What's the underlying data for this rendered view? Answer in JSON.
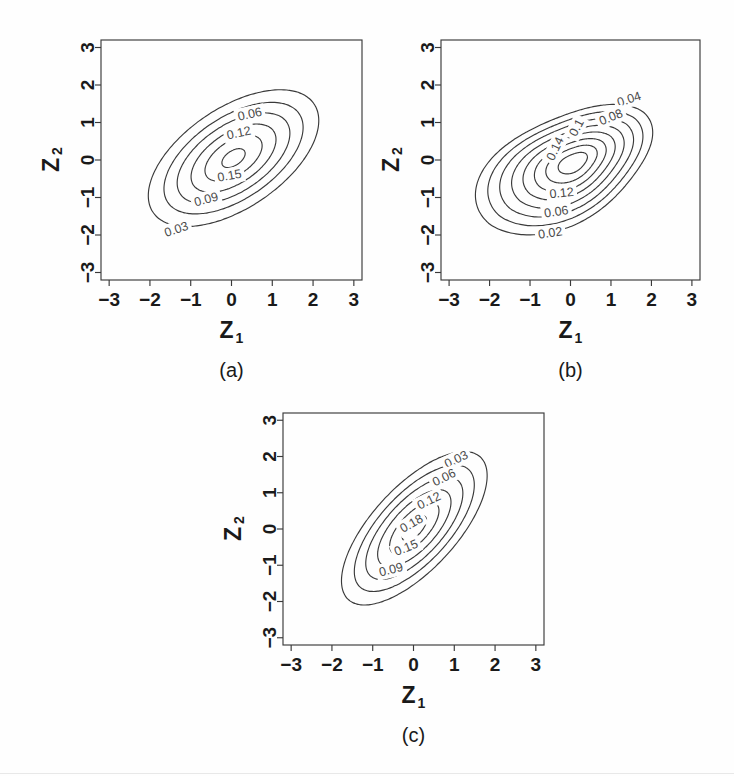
{
  "figure": {
    "kind": "contour-plot-figure",
    "background": "#fefefe",
    "stroke_color": "#3a3a3a",
    "text_color": "#1a1a1a",
    "panel_count": 3
  },
  "chart_data": [
    {
      "type": "line",
      "panel_id": "a",
      "panel_label": "(a)",
      "subtype": "contour",
      "title": "",
      "xlabel": "Z1",
      "ylabel": "Z2",
      "xlabel_display": "Z",
      "xlabel_sub": "1",
      "ylabel_display": "Z",
      "ylabel_sub": "2",
      "xlim": [
        -3.2,
        3.2
      ],
      "ylim": [
        -3.2,
        3.2
      ],
      "xticks": [
        -3,
        -2,
        -1,
        0,
        1,
        2,
        3
      ],
      "xticklabels": [
        "-3",
        "-2",
        "-1",
        "0",
        "1",
        "2",
        "3"
      ],
      "yticks": [
        -3,
        -2,
        -1,
        0,
        1,
        2,
        3
      ],
      "yticklabels": [
        "-3",
        "-2",
        "-1",
        "0",
        "1",
        "2",
        "3"
      ],
      "grid": false,
      "legend": false,
      "center": [
        0.05,
        0.05
      ],
      "orientation_deg": 38,
      "levels": [
        0.03,
        0.06,
        0.09,
        0.12,
        0.15,
        0.18
      ],
      "contour_labels": [
        "0.03",
        "0.06",
        "0.09",
        "0.12",
        "0.15"
      ],
      "contours": [
        {
          "level": 0.03,
          "label": "0.03",
          "rx": 2.45,
          "ry": 1.3,
          "label_xy": [
            -1.35,
            -1.85
          ],
          "label_rot": -18
        },
        {
          "level": 0.06,
          "label": "",
          "rx": 2.0,
          "ry": 1.06
        },
        {
          "level": 0.09,
          "label": "0.09",
          "rx": 1.62,
          "ry": 0.86,
          "label_xy": [
            -0.62,
            -1.05
          ],
          "label_rot": -15
        },
        {
          "level": 0.12,
          "label": "0.06",
          "rx": 1.22,
          "ry": 0.65,
          "label_xy": [
            0.45,
            1.22
          ],
          "label_rot": -12
        },
        {
          "level": 0.15,
          "label": "0.12",
          "rx": 0.82,
          "ry": 0.44,
          "label_xy": [
            0.18,
            0.72
          ],
          "label_rot": -12
        },
        {
          "level": 0.18,
          "label": "0.15",
          "rx": 0.33,
          "ry": 0.19,
          "label_xy": [
            -0.05,
            -0.42
          ],
          "label_rot": -10
        }
      ]
    },
    {
      "type": "line",
      "panel_id": "b",
      "panel_label": "(b)",
      "subtype": "contour",
      "title": "",
      "xlabel": "Z1",
      "ylabel": "Z2",
      "xlabel_display": "Z",
      "xlabel_sub": "1",
      "ylabel_display": "Z",
      "ylabel_sub": "2",
      "xlim": [
        -3.2,
        3.2
      ],
      "ylim": [
        -3.2,
        3.2
      ],
      "xticks": [
        -3,
        -2,
        -1,
        0,
        1,
        2,
        3
      ],
      "xticklabels": [
        "-3",
        "-2",
        "-1",
        "0",
        "1",
        "2",
        "3"
      ],
      "yticks": [
        -3,
        -2,
        -1,
        0,
        1,
        2,
        3
      ],
      "yticklabels": [
        "-3",
        "-2",
        "-1",
        "0",
        "1",
        "2",
        "3"
      ],
      "grid": false,
      "legend": false,
      "center": [
        0.1,
        -0.05
      ],
      "shape": "teardrop-skewed-upper-right",
      "levels": [
        0.02,
        0.04,
        0.06,
        0.08,
        0.1,
        0.12,
        0.14,
        0.16
      ],
      "contour_labels": [
        "0.02",
        "0.04",
        "0.06",
        "0.08",
        "0.1",
        "0.12",
        "0.14"
      ],
      "contours": [
        {
          "level": 0.02,
          "label": "0.02",
          "scale": 1.0,
          "label_xy": [
            -0.5,
            -1.95
          ],
          "label_rot": -8
        },
        {
          "level": 0.04,
          "label": "0.04",
          "scale": 0.875,
          "label_xy": [
            1.45,
            1.62
          ],
          "label_rot": -18
        },
        {
          "level": 0.06,
          "label": "0.06",
          "scale": 0.755,
          "label_xy": [
            -0.35,
            -1.38
          ],
          "label_rot": -8
        },
        {
          "level": 0.08,
          "label": "0.08",
          "scale": 0.635,
          "label_xy": [
            1.0,
            1.14
          ],
          "label_rot": -22
        },
        {
          "level": 0.1,
          "label": "0.1",
          "scale": 0.52,
          "label_xy": [
            0.15,
            0.86
          ],
          "label_rot": -62
        },
        {
          "level": 0.12,
          "label": "0.12",
          "scale": 0.405,
          "label_xy": [
            -0.22,
            -0.88
          ],
          "label_rot": -6
        },
        {
          "level": 0.14,
          "label": "0.14",
          "scale": 0.29,
          "label_xy": [
            -0.38,
            0.3
          ],
          "label_rot": -64
        },
        {
          "level": 0.16,
          "label": "",
          "scale": 0.165
        }
      ]
    },
    {
      "type": "line",
      "panel_id": "c",
      "panel_label": "(c)",
      "subtype": "contour",
      "title": "",
      "xlabel": "Z1",
      "ylabel": "Z2",
      "xlabel_display": "Z",
      "xlabel_sub": "1",
      "ylabel_display": "Z",
      "ylabel_sub": "2",
      "xlim": [
        -3.2,
        3.2
      ],
      "ylim": [
        -3.2,
        3.2
      ],
      "xticks": [
        -3,
        -2,
        -1,
        0,
        1,
        2,
        3
      ],
      "xticklabels": [
        "-3",
        "-2",
        "-1",
        "0",
        "1",
        "2",
        "3"
      ],
      "yticks": [
        -3,
        -2,
        -1,
        0,
        1,
        2,
        3
      ],
      "yticklabels": [
        "-3",
        "-2",
        "-1",
        "0",
        "1",
        "2",
        "3"
      ],
      "grid": false,
      "legend": false,
      "center": [
        0.02,
        0.02
      ],
      "orientation_deg": 52,
      "levels": [
        0.03,
        0.06,
        0.09,
        0.12,
        0.15,
        0.18
      ],
      "contour_labels": [
        "0.03",
        "0.06",
        "0.09",
        "0.12",
        "0.15",
        "0.18"
      ],
      "contours": [
        {
          "level": 0.03,
          "label": "0.03",
          "rx": 2.55,
          "ry": 1.08,
          "label_xy": [
            1.05,
            1.92
          ],
          "label_rot": -26
        },
        {
          "level": 0.06,
          "label": "0.06",
          "rx": 2.1,
          "ry": 0.89,
          "label_xy": [
            0.75,
            1.42
          ],
          "label_rot": -26
        },
        {
          "level": 0.09,
          "label": "0.09",
          "rx": 1.7,
          "ry": 0.72,
          "label_xy": [
            -0.55,
            -1.12
          ],
          "label_rot": -14
        },
        {
          "level": 0.12,
          "label": "0.12",
          "rx": 1.28,
          "ry": 0.55,
          "label_xy": [
            0.38,
            0.78
          ],
          "label_rot": -26
        },
        {
          "level": 0.15,
          "label": "0.15",
          "rx": 0.86,
          "ry": 0.37,
          "label_xy": [
            -0.18,
            -0.52
          ],
          "label_rot": -22
        },
        {
          "level": 0.18,
          "label": "0.18",
          "rx": 0.42,
          "ry": 0.19,
          "label_xy": [
            -0.05,
            0.15
          ],
          "label_rot": -30
        }
      ]
    }
  ],
  "panels": [
    {
      "id": "a",
      "label": "(b) axis labels shared",
      "panel_label": "(a)",
      "x": 14,
      "y": 18,
      "w": 360,
      "h": 372,
      "plot": {
        "left": 87,
        "top": 22,
        "right": 348,
        "bottom": 262
      }
    },
    {
      "id": "b",
      "panel_label": "(b)",
      "x": 354,
      "y": 18,
      "w": 360,
      "h": 372,
      "plot": {
        "left": 87,
        "top": 22,
        "right": 346,
        "bottom": 262
      }
    },
    {
      "id": "c",
      "panel_label": "(c)",
      "x": 196,
      "y": 392,
      "w": 360,
      "h": 372,
      "plot": {
        "left": 87,
        "top": 21,
        "right": 348,
        "bottom": 253
      }
    }
  ]
}
